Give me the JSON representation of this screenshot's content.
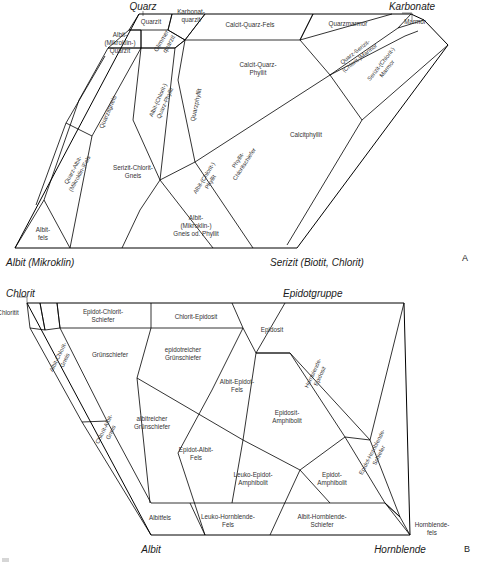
{
  "figure": {
    "panel_a_letter": "A",
    "panel_b_letter": "B"
  },
  "diagram_a": {
    "title_corners": {
      "top_left": "Quarz",
      "top_right": "Karbonate",
      "bottom_left": "Albit (Mikroklin)",
      "bottom_right": "Serizit (Biotit, Chlorit)"
    },
    "fields": [
      {
        "id": "quarzit",
        "label": "Quarzit"
      },
      {
        "id": "karbonatquarzit",
        "label": "Karbonat-\nquarzit"
      },
      {
        "id": "albit-mikroklin-quarzit",
        "label": "Albit-\n(Mikroklin-)\nQuarzit"
      },
      {
        "id": "glimmerquarzit",
        "label": "Glimmer-\nquarzit"
      },
      {
        "id": "calcit-quarz-fels",
        "label": "Calcit-Quarz-Fels"
      },
      {
        "id": "quarzmarmor",
        "label": "Quarzmarmor"
      },
      {
        "id": "marmor",
        "label": "Marmor"
      },
      {
        "id": "calcit-quarz-phyllit",
        "label": "Calcit-Quarz-\nPhyllit"
      },
      {
        "id": "quarz-serizit-chlorit-marmor",
        "label": "Quarz-Serizit-\n(Chlorit-)Marmor"
      },
      {
        "id": "serizit-chlorit-marmor",
        "label": "Serizit-(Chlorit-)\nMarmor"
      },
      {
        "id": "calcitphyllit",
        "label": "Calcitphyllit"
      },
      {
        "id": "quarzitgneis",
        "label": "Quarzitgneis"
      },
      {
        "id": "quarzphyllit",
        "label": "Quarzphyllit"
      },
      {
        "id": "albit-chlorit-quarz-phyllit",
        "label": "Albit-(Chlorit-)\nQuarz-Phyllit"
      },
      {
        "id": "quarz-albit-mikroklin-fels",
        "label": "Quarz-Albit-\n(Mikroklin-)Fels"
      },
      {
        "id": "serizit-chlorit-gneis",
        "label": "Serizit-Chlorit-\nGneis"
      },
      {
        "id": "phyllit-chloritschiefer",
        "label": "Phyllit-\nChloritschiefer"
      },
      {
        "id": "albit-chlorit-phyllit",
        "label": "Albit-(Chlorit-)\nPhyllit"
      },
      {
        "id": "albitfels",
        "label": "Albit-\nfels"
      },
      {
        "id": "albit-mikroklin-gneis-od-phyllit",
        "label": "Albit-\n(Mikroklin-)\nGneis od. Phyllit"
      }
    ]
  },
  "diagram_b": {
    "title_corners": {
      "top_left": "Chlorit",
      "top_right": "Epidotgruppe",
      "bottom_left": "Albit",
      "bottom_right": "Hornblende"
    },
    "fields": [
      {
        "id": "chloritit",
        "label": "Chloritit"
      },
      {
        "id": "epidot-chlorit-schiefer",
        "label": "Epidot-Chlorit-\nSchiefer"
      },
      {
        "id": "chlorit-epidosit",
        "label": "Chlorit-Epidosit"
      },
      {
        "id": "epidosit",
        "label": "Epidosit"
      },
      {
        "id": "albit-chlorit-gneis",
        "label": "Albit-Chlorit-\nGneis"
      },
      {
        "id": "gruenschiefer",
        "label": "Grünschiefer"
      },
      {
        "id": "epidotreicher-gruenschiefer",
        "label": "epidotreicher\nGrünschiefer"
      },
      {
        "id": "albit-epidot-fels",
        "label": "Albit-Epidot-\nFels"
      },
      {
        "id": "hornblende-epidosit",
        "label": "Hornblende-\nEpidosit"
      },
      {
        "id": "epidosit-amphibolit",
        "label": "Epidosit-\nAmphibolit"
      },
      {
        "id": "albitreicher-gruenschiefer",
        "label": "albitreicher\nGrünschiefer"
      },
      {
        "id": "chlorit-albit-gneis",
        "label": "Chlorit-Albit-\nGneis"
      },
      {
        "id": "epidot-albit-fels",
        "label": "Epidot-Albit-\nFels"
      },
      {
        "id": "leuko-epidot-amphibolit",
        "label": "Leuko-Epidot-\nAmphibolit"
      },
      {
        "id": "epidot-amphibolit",
        "label": "Epidot-\nAmphibolit"
      },
      {
        "id": "epidot-hornblende-schiefer",
        "label": "Epidot-Hornblende-\nSchiefer"
      },
      {
        "id": "albitfels-b",
        "label": "Albitfels"
      },
      {
        "id": "leuko-hornblende-fels",
        "label": "Leuko-Hornblende-\nFels"
      },
      {
        "id": "albit-hornblende-schiefer",
        "label": "Albit-Hornblende-\nSchiefer"
      },
      {
        "id": "hornblendefels",
        "label": "Hornblende-\nfels"
      }
    ]
  },
  "colors": {
    "line": "#000000",
    "label_text": "#333333",
    "corner_text": "#1a1a1a",
    "background": "#ffffff"
  }
}
